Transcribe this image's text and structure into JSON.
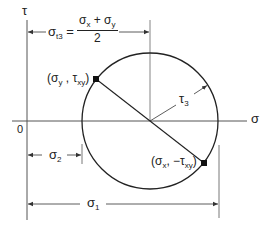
{
  "diagram": {
    "axes": {
      "horizontal": {
        "label": "σ"
      },
      "vertical": {
        "label": "τ"
      },
      "origin_label": "0"
    },
    "circle": {
      "center_label": "σ_t3",
      "radius_label": {
        "base": "τ",
        "sub": "3"
      }
    },
    "points": [
      {
        "label_open": "(σ",
        "sub1": "y",
        "sep": " , τ",
        "sub2": "xy",
        "label_close": ")"
      },
      {
        "label_open": "(σ",
        "sub1": "x",
        "sep": ", −τ",
        "sub2": "xy",
        "label_close": ")"
      }
    ],
    "dimensions": {
      "center": {
        "lhs_base": "σ",
        "lhs_sub": "t3",
        "equals": "=",
        "numerator_a": "σ",
        "numerator_a_sub": "x",
        "plus": " + ",
        "numerator_b": "σ",
        "numerator_b_sub": "y",
        "denominator": "2"
      },
      "sigma2": {
        "base": "σ",
        "sub": "2"
      },
      "sigma1": {
        "base": "σ",
        "sub": "1"
      }
    },
    "colors": {
      "line": "#222222",
      "thin_line": "#555555",
      "background": "#ffffff"
    }
  }
}
